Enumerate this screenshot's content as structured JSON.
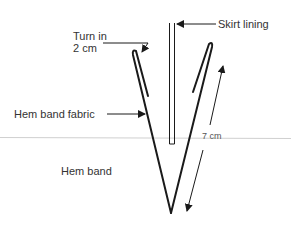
{
  "labels": {
    "turn_in_line1": "Turn in",
    "turn_in_line2": "2 cm",
    "skirt_lining": "Skirt lining",
    "hem_band_fabric": "Hem band fabric",
    "measurement": "7 cm",
    "hem_band": "Hem band"
  },
  "colors": {
    "stroke": "#1a1a1a",
    "guide_line": "#d0d0d0",
    "text": "#333333"
  }
}
